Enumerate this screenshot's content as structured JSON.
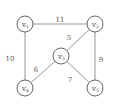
{
  "diagram": {
    "type": "weighted-undirected-graph",
    "nodes": [
      {
        "id": "v1",
        "label": "v",
        "subscript": "1",
        "x": 25,
        "y": 24
      },
      {
        "id": "v2",
        "label": "v",
        "subscript": "2",
        "x": 95,
        "y": 24
      },
      {
        "id": "v3",
        "label": "v",
        "subscript": "3",
        "x": 61,
        "y": 56
      },
      {
        "id": "v4",
        "label": "v",
        "subscript": "4",
        "x": 25,
        "y": 88
      },
      {
        "id": "v5",
        "label": "v",
        "subscript": "5",
        "x": 95,
        "y": 88
      }
    ],
    "edges": [
      {
        "from": "v1",
        "to": "v2",
        "weight": "11",
        "lx": 60,
        "ly": 20
      },
      {
        "from": "v1",
        "to": "v4",
        "weight": "10",
        "lx": 10,
        "ly": 59
      },
      {
        "from": "v2",
        "to": "v3",
        "weight": "5",
        "lx": 69,
        "ly": 38
      },
      {
        "from": "v2",
        "to": "v5",
        "weight": "9",
        "lx": 101,
        "ly": 60
      },
      {
        "from": "v3",
        "to": "v4",
        "weight": "6",
        "lx": 36,
        "ly": 70
      },
      {
        "from": "v3",
        "to": "v5",
        "weight": "7",
        "lx": 70,
        "ly": 80
      }
    ],
    "node_radius": 8
  }
}
